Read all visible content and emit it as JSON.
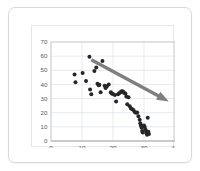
{
  "slide": {
    "background_color": "#ffffff",
    "border_color": "#d9d9d9"
  },
  "chart_data": {
    "type": "scatter",
    "title": "",
    "subtitle": "",
    "xlabel": "",
    "ylabel": "",
    "xlim": [
      0,
      40
    ],
    "ylim": [
      0,
      70
    ],
    "xticks": [
      0,
      10,
      20,
      30,
      40
    ],
    "yticks": [
      0,
      10,
      20,
      30,
      40,
      50,
      60,
      70
    ],
    "grid": true,
    "legend": false,
    "legend_position": "none",
    "point_color": "#262626",
    "point_size": 2.0,
    "series": [
      {
        "name": "observations",
        "marker": "circle",
        "points": [
          [
            7.6,
            47.0
          ],
          [
            7.9,
            41.5
          ],
          [
            10.2,
            48.0
          ],
          [
            11.3,
            42.5
          ],
          [
            12.4,
            59.5
          ],
          [
            12.6,
            36.5
          ],
          [
            13.0,
            33.0
          ],
          [
            14.0,
            49.5
          ],
          [
            14.6,
            52.0
          ],
          [
            15.0,
            40.5
          ],
          [
            15.4,
            39.5
          ],
          [
            15.6,
            39.8
          ],
          [
            16.0,
            34.5
          ],
          [
            16.6,
            56.5
          ],
          [
            17.3,
            39.0
          ],
          [
            17.6,
            37.5
          ],
          [
            18.0,
            38.5
          ],
          [
            18.6,
            40.0
          ],
          [
            19.3,
            34.5
          ],
          [
            19.6,
            33.5
          ],
          [
            20.0,
            33.2
          ],
          [
            20.6,
            32.5
          ],
          [
            21.0,
            28.0
          ],
          [
            21.6,
            33.0
          ],
          [
            22.0,
            33.8
          ],
          [
            22.4,
            34.5
          ],
          [
            22.7,
            35.0
          ],
          [
            23.0,
            35.2
          ],
          [
            23.3,
            34.8
          ],
          [
            23.6,
            34.0
          ],
          [
            24.0,
            33.5
          ],
          [
            24.3,
            31.5
          ],
          [
            24.6,
            26.0
          ],
          [
            25.0,
            31.0
          ],
          [
            25.4,
            24.5
          ],
          [
            25.8,
            23.0
          ],
          [
            26.2,
            22.5
          ],
          [
            26.6,
            22.0
          ],
          [
            27.0,
            20.5
          ],
          [
            27.4,
            20.0
          ],
          [
            27.8,
            20.2
          ],
          [
            28.2,
            17.5
          ],
          [
            28.6,
            15.0
          ],
          [
            28.8,
            12.5
          ],
          [
            29.0,
            11.0
          ],
          [
            29.2,
            9.5
          ],
          [
            29.4,
            7.0
          ],
          [
            29.6,
            6.0
          ],
          [
            29.8,
            10.5
          ],
          [
            30.0,
            11.0
          ],
          [
            30.2,
            10.0
          ],
          [
            30.4,
            8.5
          ],
          [
            30.6,
            7.5
          ],
          [
            30.8,
            5.5
          ],
          [
            31.0,
            4.5
          ],
          [
            31.2,
            16.5
          ],
          [
            31.4,
            6.5
          ],
          [
            31.6,
            5.0
          ]
        ]
      }
    ],
    "annotations": [
      {
        "name": "trend-arrow",
        "type": "arrow",
        "color": "#7f7f7f",
        "start": [
          13.0,
          57.5
        ],
        "end": [
          38.0,
          28.0
        ],
        "description": "downward trend arrow"
      }
    ]
  }
}
